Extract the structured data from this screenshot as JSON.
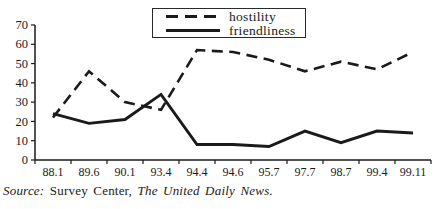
{
  "chart_data": {
    "type": "line",
    "title": "",
    "categories": [
      "88.1",
      "89.6",
      "90.1",
      "93.4",
      "94.4",
      "94.6",
      "95.7",
      "97.7",
      "98.7",
      "99.4",
      "99.11"
    ],
    "series": [
      {
        "name": "hostility",
        "style": "dashed",
        "values": [
          22,
          46,
          30,
          26,
          57,
          56,
          52,
          46,
          51,
          47,
          56
        ]
      },
      {
        "name": "friendliness",
        "style": "solid",
        "values": [
          24,
          19,
          21,
          34,
          8,
          8,
          7,
          15,
          9,
          15,
          14
        ]
      }
    ],
    "xlabel": "",
    "ylabel": "",
    "ylim": [
      0,
      70
    ],
    "yticks": [
      0,
      10,
      20,
      30,
      40,
      50,
      60,
      70
    ],
    "grid": false,
    "legend_position": "top-center",
    "line_color": "#1a1a1a",
    "axis_color": "#1a1a1a"
  },
  "source": {
    "prefix": "Source:",
    "org": " Survey Center, ",
    "publication": "The United Daily News."
  }
}
